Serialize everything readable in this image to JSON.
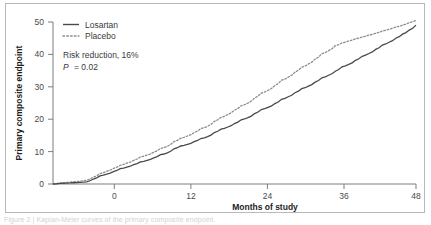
{
  "figure": {
    "caption": "Figure 2 | Kaplan-Meier curves of the primary composite endpoint.",
    "frame_color": "#b9b9b9",
    "background": "#ffffff"
  },
  "chart_data": {
    "type": "line",
    "title": "",
    "xlabel": "Months of study",
    "ylabel": "Primary composite endpoint",
    "xlim": [
      -6,
      48
    ],
    "ylim": [
      0,
      52
    ],
    "xticks": [
      0,
      12,
      24,
      36,
      48
    ],
    "xtick_labels": [
      "0",
      "12",
      "24",
      "36",
      "48"
    ],
    "yticks": [
      0,
      10,
      20,
      30,
      40,
      50
    ],
    "ytick_labels": [
      "0",
      "10",
      "20",
      "30",
      "40",
      "50"
    ],
    "grid": false,
    "legend_position": "top-left",
    "line_color": "#4a4a4a",
    "annotations": [
      {
        "text": "Risk reduction, 16%",
        "style": "normal"
      },
      {
        "text": "P = 0.02",
        "style": "italic-p"
      }
    ],
    "x": [
      -6,
      -5,
      -4,
      -3,
      -2,
      -1,
      0,
      1,
      2,
      3,
      4,
      5,
      6,
      7,
      8,
      9,
      10,
      11,
      12,
      13,
      14,
      15,
      16,
      17,
      18,
      19,
      20,
      21,
      22,
      23,
      24,
      25,
      26,
      27,
      28,
      29,
      30,
      31,
      32,
      33,
      34,
      35,
      36,
      37,
      38,
      39,
      40,
      41,
      42,
      43,
      44,
      45,
      46,
      47,
      48
    ],
    "series": [
      {
        "name": "Losartan",
        "style": "solid",
        "color": "#4a4a4a",
        "values": [
          0.0,
          0.2,
          0.3,
          0.4,
          0.5,
          0.7,
          1.6,
          2.6,
          3.2,
          4.0,
          4.9,
          5.4,
          6.2,
          7.1,
          7.6,
          8.4,
          9.4,
          10.0,
          11.3,
          12.2,
          12.7,
          13.6,
          14.6,
          15.2,
          16.5,
          17.6,
          18.3,
          19.4,
          20.6,
          21.3,
          22.6,
          23.9,
          24.6,
          25.8,
          27.2,
          28.0,
          29.3,
          30.6,
          31.4,
          32.7,
          34.1,
          34.9,
          36.2,
          37.6,
          38.4,
          39.7,
          41.0,
          41.9,
          43.2,
          44.6,
          45.5,
          46.8,
          48.1,
          49.4,
          51.0
        ]
      },
      {
        "name": "Placebo",
        "style": "dotted",
        "color": "#8c8c8c",
        "values": [
          0.0,
          0.3,
          0.5,
          0.7,
          0.9,
          1.2,
          2.2,
          3.3,
          4.1,
          5.0,
          6.0,
          6.7,
          7.6,
          8.7,
          9.3,
          10.2,
          11.4,
          12.1,
          13.6,
          14.7,
          15.4,
          16.5,
          17.8,
          18.5,
          20.1,
          21.4,
          22.3,
          23.7,
          25.1,
          26.0,
          27.6,
          29.2,
          30.1,
          31.6,
          33.3,
          34.3,
          35.9,
          37.5,
          38.5,
          40.1,
          41.8,
          42.8,
          44.4,
          45.3,
          45.9,
          46.6,
          47.2,
          47.8,
          48.4,
          49.1,
          49.7,
          50.4,
          51.0,
          51.8,
          52.5
        ]
      }
    ]
  }
}
